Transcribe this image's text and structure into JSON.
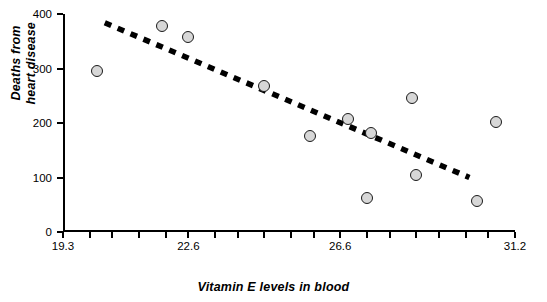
{
  "chart_data": {
    "type": "scatter",
    "title": "",
    "xlabel": "Vitamin E levels in blood",
    "ylabel": "Deaths from heart disease",
    "xlim": [
      19.3,
      31.2
    ],
    "ylim": [
      0,
      400
    ],
    "xticks": [
      19.3,
      22.6,
      26.6,
      31.2
    ],
    "xtick_labels": [
      "19.3",
      "22.6",
      "26.6",
      "31.2"
    ],
    "xminor_ticks": [
      20.0,
      20.6,
      21.3,
      22.0,
      23.3,
      23.9,
      24.6,
      25.3,
      25.9,
      27.3,
      27.9,
      28.6,
      29.2,
      29.9,
      30.5
    ],
    "yticks": [
      0,
      100,
      200,
      300,
      400
    ],
    "ytick_labels": [
      "0",
      "100",
      "200",
      "300",
      "400"
    ],
    "grid": false,
    "legend": null,
    "points": [
      {
        "x": 20.2,
        "y": 295
      },
      {
        "x": 21.9,
        "y": 378
      },
      {
        "x": 22.6,
        "y": 358
      },
      {
        "x": 24.6,
        "y": 267
      },
      {
        "x": 25.8,
        "y": 177
      },
      {
        "x": 26.8,
        "y": 207
      },
      {
        "x": 27.4,
        "y": 181
      },
      {
        "x": 27.3,
        "y": 62
      },
      {
        "x": 28.5,
        "y": 245
      },
      {
        "x": 28.6,
        "y": 105
      },
      {
        "x": 30.2,
        "y": 57
      },
      {
        "x": 30.7,
        "y": 202
      }
    ],
    "trendline": {
      "style": "dotted",
      "color": "#000000",
      "x_start": 20.4,
      "y_start": 384,
      "x_end": 30.0,
      "y_end": 100
    }
  },
  "ylabel_lines": [
    "Deaths from",
    "heart disease"
  ]
}
